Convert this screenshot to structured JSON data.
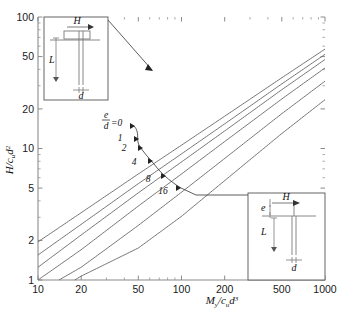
{
  "chart_data": {
    "type": "line",
    "title": "",
    "xlabel": "My/cu d3",
    "ylabel": "H/cu d2",
    "xscale": "log",
    "yscale": "log",
    "xlim": [
      10,
      1000
    ],
    "ylim": [
      1,
      100
    ],
    "grid": false,
    "legend_position": "inline-curve-labels",
    "xticks": [
      10,
      20,
      50,
      100,
      200,
      500,
      1000
    ],
    "xtick_labels": [
      "10",
      "20",
      "50",
      "100",
      "200",
      "500",
      "1000"
    ],
    "yticks": [
      1,
      2,
      5,
      10,
      20,
      50,
      100
    ],
    "ytick_labels": [
      "1",
      "2",
      "5",
      "10",
      "20",
      "50",
      "100"
    ],
    "series_parameter": "e/d",
    "series": [
      {
        "name": "0",
        "label": "0",
        "e_over_d": 0,
        "x": [
          10,
          20,
          50,
          100,
          200,
          500,
          1000
        ],
        "y": [
          1.95,
          3.25,
          6.4,
          10.6,
          17.6,
          34.5,
          57.0
        ]
      },
      {
        "name": "1",
        "label": "1",
        "e_over_d": 1,
        "x": [
          10,
          20,
          50,
          100,
          200,
          500,
          1000
        ],
        "y": [
          1.55,
          2.65,
          5.4,
          9.1,
          15.4,
          31.0,
          52.0
        ]
      },
      {
        "name": "2",
        "label": "2",
        "e_over_d": 2,
        "x": [
          10,
          20,
          50,
          100,
          200,
          500,
          1000
        ],
        "y": [
          1.25,
          2.2,
          4.6,
          7.9,
          13.6,
          28.0,
          47.5
        ]
      },
      {
        "name": "4",
        "label": "4",
        "e_over_d": 4,
        "x": [
          10,
          20,
          50,
          100,
          200,
          500,
          1000
        ],
        "y": [
          1.0,
          1.7,
          3.65,
          6.4,
          11.3,
          23.8,
          41.0
        ]
      },
      {
        "name": "8",
        "label": "8",
        "e_over_d": 8,
        "x": [
          14,
          20,
          50,
          100,
          200,
          500,
          1000
        ],
        "y": [
          1.0,
          1.25,
          2.6,
          4.65,
          8.4,
          18.4,
          32.5
        ]
      },
      {
        "name": "16",
        "label": "16",
        "e_over_d": 16,
        "x": [
          18,
          20,
          50,
          100,
          200,
          500,
          1000
        ],
        "y": [
          1.0,
          1.07,
          1.75,
          3.05,
          5.7,
          13.0,
          23.5
        ]
      }
    ],
    "annotations": [
      {
        "text": "e/d=0",
        "kind": "series-label"
      },
      {
        "text": "1",
        "kind": "series-label"
      },
      {
        "text": "2",
        "kind": "series-label"
      },
      {
        "text": "4",
        "kind": "series-label"
      },
      {
        "text": "8",
        "kind": "series-label"
      },
      {
        "text": "16",
        "kind": "series-label"
      }
    ]
  },
  "axes": {
    "y_label_num": "H",
    "y_label_den_main": "c",
    "y_label_den_sub": "u",
    "y_label_den_var": "d",
    "y_label_den_exp": "2",
    "x_label_num": "M",
    "x_label_num_sub": "y",
    "x_label_den_main": "c",
    "x_label_den_sub": "u",
    "x_label_den_var": "d",
    "x_label_den_exp": "3",
    "x_ticks": [
      "10",
      "20",
      "50",
      "100",
      "200",
      "500",
      "1000"
    ],
    "y_ticks": [
      "100",
      "50",
      "20",
      "10",
      "5",
      "2",
      "1"
    ]
  },
  "curve_labels": {
    "first_prefix_num": "e",
    "first_prefix_den": "d",
    "first_eq": "=0",
    "items": [
      "1",
      "2",
      "4",
      "8",
      "16"
    ]
  },
  "inset_top_left": {
    "name": "free-head-pile-at-ground-level",
    "load_label": "H",
    "length_label": "L",
    "diameter_label": "d"
  },
  "inset_bottom_right": {
    "name": "pile-with-load-eccentricity",
    "load_label": "H",
    "eccentricity_label": "e",
    "length_label": "L",
    "diameter_label": "d"
  },
  "colors": {
    "curve": "#6b6b6b",
    "axis": "#8a8a8a",
    "text": "#111111",
    "inset_line": "#7a7a7a",
    "background": "#ffffff"
  }
}
